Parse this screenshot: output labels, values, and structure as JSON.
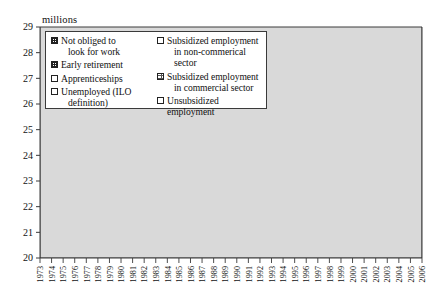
{
  "chart_data": {
    "type": "area",
    "stacked": true,
    "title": "",
    "subtitle": "",
    "ylabel": "millions",
    "xlabel": "",
    "ylim": [
      20,
      29
    ],
    "yticks": [
      20,
      21,
      22,
      23,
      24,
      25,
      26,
      27,
      28,
      29
    ],
    "grid": false,
    "legend_position": "top-left-inside",
    "x": [
      1973,
      1974,
      1975,
      1976,
      1977,
      1978,
      1979,
      1980,
      1981,
      1982,
      1983,
      1984,
      1985,
      1986,
      1987,
      1988,
      1989,
      1990,
      1991,
      1992,
      1993,
      1994,
      1995,
      1996,
      1997,
      1998,
      1999,
      2000,
      2001,
      2002,
      2003,
      2004,
      2005,
      2006
    ],
    "categories": [
      "1973",
      "1974",
      "1975",
      "1976",
      "1977",
      "1978",
      "1979",
      "1980",
      "1981",
      "1982",
      "1983",
      "1984",
      "1985",
      "1986",
      "1987",
      "1988",
      "1989",
      "1990",
      "1991",
      "1992",
      "1993",
      "1994",
      "1995",
      "1996",
      "1997",
      "1998",
      "1999",
      "2000",
      "2001",
      "2002",
      "2003",
      "2004",
      "2005",
      "2006"
    ],
    "series": [
      {
        "name": "Unsubsidized employment",
        "pattern": "solid-light-gray",
        "color": "#d9d9d9",
        "values": [
          20.95,
          21.0,
          21.05,
          21.1,
          21.1,
          21.05,
          21.05,
          21.0,
          20.85,
          20.8,
          20.7,
          20.55,
          20.45,
          20.5,
          20.5,
          20.6,
          20.8,
          20.95,
          20.9,
          20.75,
          20.55,
          20.6,
          20.75,
          20.8,
          20.95,
          21.2,
          21.55,
          21.95,
          22.25,
          22.3,
          22.35,
          22.45,
          22.65,
          22.95
        ]
      },
      {
        "name": "Unemployed (ILO definition)",
        "pattern": "horizontal-lines",
        "color": "#ffffff",
        "values": [
          0.42,
          0.48,
          0.75,
          0.85,
          0.95,
          1.0,
          1.15,
          1.2,
          1.45,
          1.6,
          1.7,
          1.9,
          2.0,
          2.0,
          2.05,
          1.95,
          1.8,
          1.7,
          1.8,
          1.95,
          2.25,
          2.3,
          2.2,
          2.25,
          2.25,
          2.1,
          1.95,
          1.7,
          1.5,
          1.6,
          1.7,
          1.75,
          1.75,
          1.7
        ]
      },
      {
        "name": "Subsidized employment in non-commerical sector",
        "pattern": "fine-dotted",
        "color": "#ffffff",
        "values": [
          0.02,
          0.02,
          0.03,
          0.05,
          0.08,
          0.1,
          0.12,
          0.13,
          0.15,
          0.2,
          0.24,
          0.28,
          0.32,
          0.36,
          0.4,
          0.44,
          0.46,
          0.45,
          0.48,
          0.55,
          0.62,
          0.66,
          0.62,
          0.65,
          0.7,
          0.72,
          0.7,
          0.62,
          0.52,
          0.46,
          0.42,
          0.4,
          0.42,
          0.4
        ]
      },
      {
        "name": "Apprenticeships",
        "pattern": "diagonal-hatch",
        "color": "#ffffff",
        "values": [
          0.18,
          0.2,
          0.22,
          0.23,
          0.24,
          0.25,
          0.25,
          0.26,
          0.26,
          0.27,
          0.27,
          0.28,
          0.28,
          0.29,
          0.3,
          0.31,
          0.32,
          0.33,
          0.34,
          0.34,
          0.33,
          0.34,
          0.35,
          0.36,
          0.37,
          0.39,
          0.41,
          0.43,
          0.44,
          0.44,
          0.45,
          0.46,
          0.47,
          0.48
        ]
      },
      {
        "name": "Early retirement",
        "pattern": "cross-hatch-grid",
        "color": "#ffffff",
        "values": [
          0.05,
          0.07,
          0.1,
          0.14,
          0.18,
          0.24,
          0.3,
          0.36,
          0.42,
          0.5,
          0.58,
          0.66,
          0.7,
          0.72,
          0.72,
          0.7,
          0.66,
          0.6,
          0.56,
          0.52,
          0.5,
          0.48,
          0.46,
          0.44,
          0.42,
          0.4,
          0.38,
          0.34,
          0.3,
          0.28,
          0.26,
          0.24,
          0.22,
          0.2
        ]
      },
      {
        "name": "Not obliged to look for work",
        "pattern": "dense-grid",
        "color": "#ffffff",
        "values": [
          0.1,
          0.12,
          0.14,
          0.16,
          0.18,
          0.2,
          0.22,
          0.25,
          0.28,
          0.32,
          0.36,
          0.4,
          0.44,
          0.48,
          0.52,
          0.56,
          0.6,
          0.62,
          0.64,
          0.66,
          0.68,
          0.7,
          0.72,
          0.74,
          0.76,
          0.78,
          0.8,
          0.82,
          0.84,
          0.86,
          0.88,
          0.9,
          0.92,
          0.94
        ]
      }
    ],
    "totals": [
      21.72,
      21.89,
      22.29,
      22.53,
      22.73,
      22.84,
      23.09,
      23.2,
      23.41,
      23.69,
      23.85,
      24.07,
      24.19,
      24.35,
      24.49,
      24.56,
      24.64,
      24.65,
      24.72,
      24.77,
      24.93,
      25.08,
      25.1,
      25.24,
      25.45,
      25.59,
      25.79,
      25.86,
      25.85,
      25.94,
      26.06,
      26.2,
      26.43,
      26.67
    ]
  },
  "axes": {
    "unit_label": "millions",
    "y_ticks": [
      "29",
      "28",
      "27",
      "26",
      "25",
      "24",
      "23",
      "22",
      "21",
      "20"
    ],
    "x_ticks": [
      "1973",
      "1974",
      "1975",
      "1976",
      "1977",
      "1978",
      "1979",
      "1980",
      "1981",
      "1982",
      "1983",
      "1984",
      "1985",
      "1986",
      "1987",
      "1988",
      "1989",
      "1990",
      "1991",
      "1992",
      "1993",
      "1994",
      "1995",
      "1996",
      "1997",
      "1998",
      "1999",
      "2000",
      "2001",
      "2002",
      "2003",
      "2004",
      "2005",
      "2006"
    ]
  },
  "legend": {
    "items": [
      {
        "label_line1": "Not obliged to",
        "label_line2": "look for work",
        "swatch": "dense-grid"
      },
      {
        "label_line1": "Subsidized employment",
        "label_line2": "in non-commerical sector",
        "swatch": "fine-dotted"
      },
      {
        "label_line1": "Early retirement",
        "label_line2": "",
        "swatch": "cross-hatch-grid"
      },
      {
        "label_line1": "Subsidized employment",
        "label_line2": "in commercial sector",
        "swatch": "diagonal-hatch"
      },
      {
        "label_line1": "Apprenticeships",
        "label_line2": "",
        "swatch": "diagonal-hatch"
      },
      {
        "label_line1": "Unsubsidized employment",
        "label_line2": "",
        "swatch": "solid-light-gray"
      },
      {
        "label_line1": "Unemployed (ILO",
        "label_line2": "definition)",
        "swatch": "horizontal-lines"
      }
    ]
  },
  "colors": {
    "axis": "#3a3a3a",
    "area_fill_light": "#d9d9d9",
    "hatch_stroke": "#333333",
    "background": "#ffffff"
  }
}
